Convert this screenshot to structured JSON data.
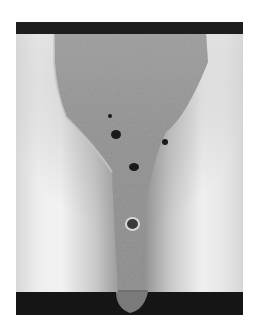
{
  "image": {
    "description": "Grayscale micrograph of a weld cross-section showing a wide crown narrowing to a root, with several porosity voids",
    "colors": {
      "background": "#ffffff",
      "plate_light": "#f0f0f0",
      "weld_metal": "#8a8a8a",
      "dark_band": "#1a1a1a",
      "pore": "#1a1a1a"
    },
    "pores": [
      {
        "x": 110,
        "y": 116,
        "r": 2
      },
      {
        "x": 116,
        "y": 135,
        "r": 5
      },
      {
        "x": 165,
        "y": 142,
        "r": 3
      },
      {
        "x": 134,
        "y": 167,
        "r": 5
      },
      {
        "x": 133,
        "y": 224,
        "r": 6
      }
    ]
  }
}
